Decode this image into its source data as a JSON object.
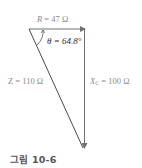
{
  "figure": {
    "caption": "그림 10-6",
    "resistance": {
      "symbol": "R",
      "equals": " = ",
      "value": "47 Ω"
    },
    "angle": {
      "symbol": "θ",
      "text": " = 64.8°"
    },
    "impedance": {
      "symbol": "Z",
      "text": " = 110 Ω"
    },
    "reactance": {
      "symbol": "X",
      "subscript": "C",
      "text": " = 100 Ω"
    }
  },
  "colors": {
    "lines": "#707070",
    "labels": "#8a8a8a",
    "theta": "#2b2b2b",
    "caption": "#555555"
  }
}
